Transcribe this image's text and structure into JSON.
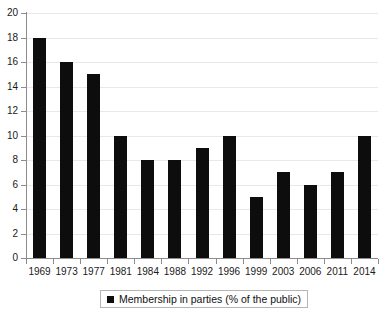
{
  "chart_data": {
    "type": "bar",
    "title": "",
    "subtitle": "",
    "xlabel": "",
    "ylabel": "",
    "categories": [
      "1969",
      "1973",
      "1977",
      "1981",
      "1984",
      "1988",
      "1992",
      "1996",
      "1999",
      "2003",
      "2006",
      "2011",
      "2014"
    ],
    "values": [
      18,
      16,
      15,
      10,
      8,
      8,
      9,
      10,
      5,
      7,
      6,
      7,
      10
    ],
    "series": [
      {
        "name": "Membership in parties (% of the public)",
        "values": [
          18,
          16,
          15,
          10,
          8,
          8,
          9,
          10,
          5,
          7,
          6,
          7,
          10
        ],
        "color": "#0d0d0d"
      }
    ],
    "ylim": [
      0,
      20
    ],
    "ytick_values": [
      0,
      2,
      4,
      6,
      8,
      10,
      12,
      14,
      16,
      18,
      20
    ],
    "ytick_labels": [
      "0",
      "2",
      "4",
      "6",
      "8",
      "10",
      "12",
      "14",
      "16",
      "18",
      "20"
    ],
    "grid": "horizontal",
    "legend_position": "bottom-center",
    "legend_entries": [
      {
        "label": "Membership in parties (% of the public)",
        "marker": "square",
        "color": "#0d0d0d"
      }
    ]
  },
  "colors": {
    "bar": "#0d0d0d",
    "grid": "#e8e8e8",
    "axis": "#8c8c8c",
    "text": "#1a1a1a",
    "legend_border": "#b5b5b5",
    "background": "#ffffff"
  }
}
